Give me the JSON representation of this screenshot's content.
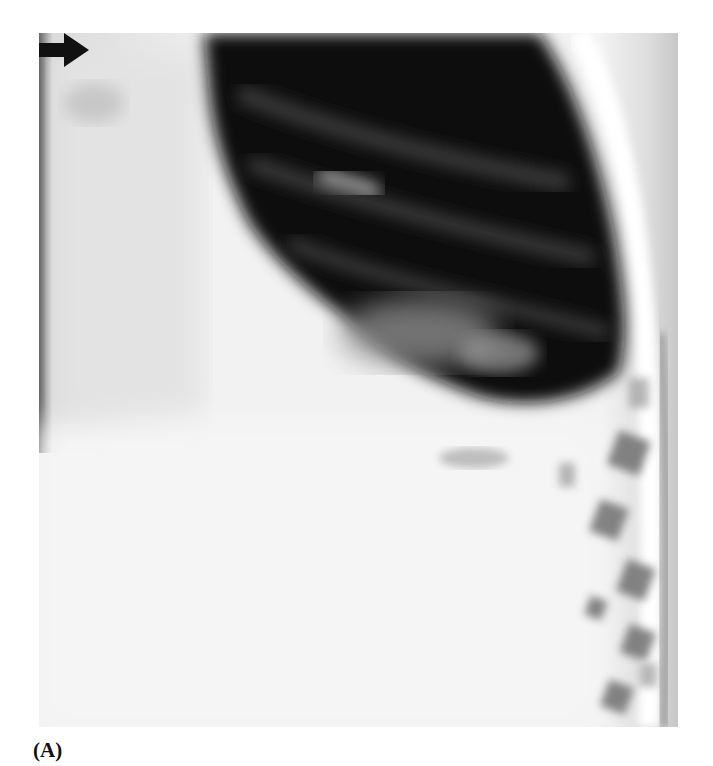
{
  "figure": {
    "panel_label": "(A)",
    "image_type": "chest radiograph",
    "annotations": [
      {
        "type": "arrow",
        "direction": "right",
        "color": "#111111"
      }
    ]
  },
  "colors": {
    "background": "#ffffff",
    "film_light": "#f1f1f1",
    "lung_dark": "#0d0d0d"
  }
}
